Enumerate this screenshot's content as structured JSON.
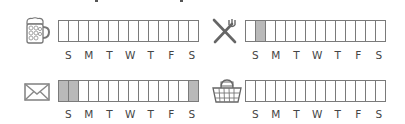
{
  "day_labels": [
    "S",
    "M",
    "T",
    "W",
    "T",
    "F",
    "S"
  ],
  "colors": {
    "border": "#7a7a7a",
    "filled": "#b9b9b9",
    "empty": "#ffffff",
    "label": "#444444"
  },
  "trackers": [
    {
      "id": "beer",
      "icon": "beer-mug-icon",
      "slots": 14,
      "filled": []
    },
    {
      "id": "dining",
      "icon": "fork-knife-icon",
      "slots": 14,
      "filled": [
        2
      ]
    },
    {
      "id": "mail",
      "icon": "envelope-icon",
      "slots": 14,
      "filled": [
        1,
        2,
        14
      ]
    },
    {
      "id": "shopping",
      "icon": "basket-icon",
      "slots": 14,
      "filled": []
    }
  ]
}
